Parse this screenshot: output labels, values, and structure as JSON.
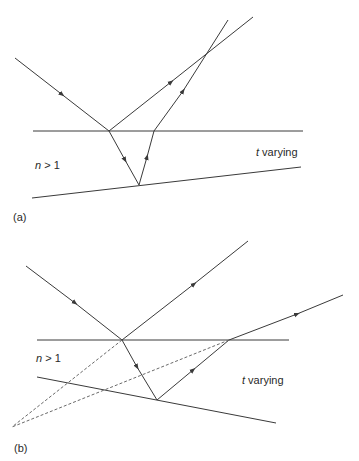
{
  "panels": [
    {
      "id": "a",
      "caption": "(a)",
      "medium_label_var": "n",
      "medium_label_rest": " > 1",
      "thickness_label_var": "t",
      "thickness_label_rest": " varying",
      "description": "Wedge-shaped film: incident ray reflects at top surface and refracts into film, reflects off bottom surface and exits; two emerging rays converge and cross above the film."
    },
    {
      "id": "b",
      "caption": "(b)",
      "medium_label_var": "n",
      "medium_label_rest": " > 1",
      "thickness_label_var": "t",
      "thickness_label_rest": " varying",
      "description": "Wedge-shaped film oriented oppositely: emerging rays diverge; dashed back-extensions of the two emerging rays meet below the film."
    }
  ],
  "colors": {
    "line": "#3a3a3a",
    "dashed": "#6a6a6a",
    "background": "#ffffff"
  }
}
